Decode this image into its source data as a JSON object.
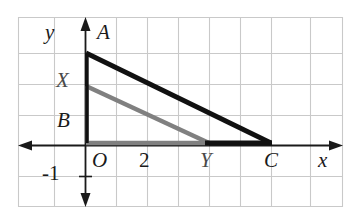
{
  "figure": {
    "colors": {
      "grid": "#c9c9c9",
      "axis": "#1a1a1a",
      "triangle_black": "#111111",
      "triangle_gray": "#808080",
      "background": "#ffffff",
      "label": "#1a1a1a"
    },
    "axes": {
      "x_axis_label": "x",
      "y_axis_label": "y",
      "origin_label": "O",
      "x_tick_label": "2",
      "y_tick_label": "-1"
    },
    "points": [
      {
        "name": "A",
        "label": "A",
        "x": 0,
        "y": 3,
        "series": "black"
      },
      {
        "name": "X",
        "label": "X",
        "x": 0,
        "y": 2,
        "series": "gray"
      },
      {
        "name": "B",
        "label": "B",
        "x": 0,
        "y": 1,
        "series": "axis"
      },
      {
        "name": "O",
        "label": "O",
        "x": 0,
        "y": 0,
        "series": "axis"
      },
      {
        "name": "Y",
        "label": "Y",
        "x": 4,
        "y": 0,
        "series": "gray"
      },
      {
        "name": "C",
        "label": "C",
        "x": 6,
        "y": 0,
        "series": "black"
      }
    ],
    "shapes": [
      {
        "name": "black-triangle",
        "vertices": [
          "O",
          "A",
          "C"
        ],
        "color": "#111111",
        "stroke_width": 4
      },
      {
        "name": "gray-triangle",
        "vertices": [
          "O",
          "X",
          "Y"
        ],
        "color": "#808080",
        "stroke_width": 4
      }
    ],
    "grid": {
      "cell_size_px": 30.7,
      "columns": 10,
      "rows": 6,
      "visible": true
    }
  }
}
